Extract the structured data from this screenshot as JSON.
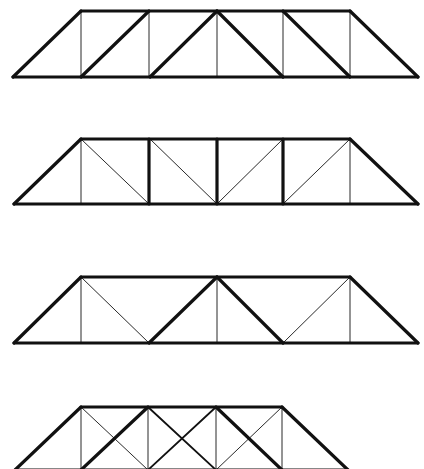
{
  "diagram": {
    "title": "",
    "background": "#ffffff",
    "stroke_color": "#111111",
    "stroke_widths": {
      "thick": 3.2,
      "medium": 1.8,
      "thin": 0.9
    },
    "trusses": [
      {
        "name": "truss-1",
        "type": "howe-style",
        "top_y": 11,
        "bottom_y": 77,
        "members": [
          {
            "x1": 13,
            "y1": 77,
            "x2": 418,
            "y2": 77,
            "w": "thick",
            "role": "bottom-chord"
          },
          {
            "x1": 81,
            "y1": 11,
            "x2": 350,
            "y2": 11,
            "w": "thick",
            "role": "top-chord"
          },
          {
            "x1": 13,
            "y1": 77,
            "x2": 81,
            "y2": 11,
            "w": "thick",
            "role": "end-post-left"
          },
          {
            "x1": 350,
            "y1": 11,
            "x2": 418,
            "y2": 77,
            "w": "thick",
            "role": "end-post-right"
          },
          {
            "x1": 81,
            "y1": 11,
            "x2": 81,
            "y2": 77,
            "w": "thin",
            "role": "vertical"
          },
          {
            "x1": 149,
            "y1": 11,
            "x2": 149,
            "y2": 77,
            "w": "thin",
            "role": "vertical"
          },
          {
            "x1": 217,
            "y1": 11,
            "x2": 217,
            "y2": 77,
            "w": "thin",
            "role": "vertical"
          },
          {
            "x1": 283,
            "y1": 11,
            "x2": 283,
            "y2": 77,
            "w": "thin",
            "role": "vertical"
          },
          {
            "x1": 350,
            "y1": 11,
            "x2": 350,
            "y2": 77,
            "w": "thin",
            "role": "vertical"
          },
          {
            "x1": 81,
            "y1": 77,
            "x2": 149,
            "y2": 11,
            "w": "thick",
            "role": "diagonal"
          },
          {
            "x1": 150,
            "y1": 77,
            "x2": 217,
            "y2": 11,
            "w": "thick",
            "role": "diagonal"
          },
          {
            "x1": 217,
            "y1": 11,
            "x2": 283,
            "y2": 77,
            "w": "thick",
            "role": "diagonal"
          },
          {
            "x1": 283,
            "y1": 11,
            "x2": 350,
            "y2": 77,
            "w": "thick",
            "role": "diagonal"
          }
        ]
      },
      {
        "name": "truss-2",
        "type": "pratt-style",
        "top_y": 139,
        "bottom_y": 204,
        "members": [
          {
            "x1": 14,
            "y1": 204,
            "x2": 418,
            "y2": 204,
            "w": "thick",
            "role": "bottom-chord"
          },
          {
            "x1": 81,
            "y1": 139,
            "x2": 350,
            "y2": 139,
            "w": "thick",
            "role": "top-chord"
          },
          {
            "x1": 14,
            "y1": 204,
            "x2": 81,
            "y2": 139,
            "w": "thick",
            "role": "end-post-left"
          },
          {
            "x1": 350,
            "y1": 139,
            "x2": 418,
            "y2": 204,
            "w": "thick",
            "role": "end-post-right"
          },
          {
            "x1": 81,
            "y1": 139,
            "x2": 81,
            "y2": 204,
            "w": "thin",
            "role": "vertical"
          },
          {
            "x1": 149,
            "y1": 139,
            "x2": 149,
            "y2": 204,
            "w": "thick",
            "role": "vertical"
          },
          {
            "x1": 217,
            "y1": 139,
            "x2": 217,
            "y2": 204,
            "w": "thick",
            "role": "vertical"
          },
          {
            "x1": 283,
            "y1": 139,
            "x2": 283,
            "y2": 204,
            "w": "thick",
            "role": "vertical"
          },
          {
            "x1": 350,
            "y1": 139,
            "x2": 350,
            "y2": 204,
            "w": "thin",
            "role": "vertical"
          },
          {
            "x1": 81,
            "y1": 139,
            "x2": 149,
            "y2": 204,
            "w": "thin",
            "role": "diagonal"
          },
          {
            "x1": 150,
            "y1": 139,
            "x2": 217,
            "y2": 204,
            "w": "thin",
            "role": "diagonal"
          },
          {
            "x1": 217,
            "y1": 204,
            "x2": 283,
            "y2": 139,
            "w": "thin",
            "role": "diagonal"
          },
          {
            "x1": 283,
            "y1": 204,
            "x2": 350,
            "y2": 139,
            "w": "thin",
            "role": "diagonal"
          }
        ]
      },
      {
        "name": "truss-3",
        "type": "warren-with-verticals",
        "top_y": 277,
        "bottom_y": 343,
        "members": [
          {
            "x1": 14,
            "y1": 343,
            "x2": 418,
            "y2": 343,
            "w": "thick",
            "role": "bottom-chord"
          },
          {
            "x1": 81,
            "y1": 277,
            "x2": 350,
            "y2": 277,
            "w": "thick",
            "role": "top-chord"
          },
          {
            "x1": 14,
            "y1": 343,
            "x2": 81,
            "y2": 277,
            "w": "thick",
            "role": "end-post-left"
          },
          {
            "x1": 350,
            "y1": 277,
            "x2": 418,
            "y2": 343,
            "w": "thick",
            "role": "end-post-right"
          },
          {
            "x1": 81,
            "y1": 277,
            "x2": 81,
            "y2": 343,
            "w": "thin",
            "role": "vertical"
          },
          {
            "x1": 217,
            "y1": 277,
            "x2": 217,
            "y2": 343,
            "w": "thin",
            "role": "vertical"
          },
          {
            "x1": 350,
            "y1": 277,
            "x2": 350,
            "y2": 343,
            "w": "thin",
            "role": "vertical"
          },
          {
            "x1": 81,
            "y1": 277,
            "x2": 149,
            "y2": 343,
            "w": "thin",
            "role": "diagonal"
          },
          {
            "x1": 149,
            "y1": 343,
            "x2": 217,
            "y2": 277,
            "w": "thick",
            "role": "diagonal"
          },
          {
            "x1": 217,
            "y1": 277,
            "x2": 283,
            "y2": 343,
            "w": "thick",
            "role": "diagonal"
          },
          {
            "x1": 283,
            "y1": 343,
            "x2": 350,
            "y2": 277,
            "w": "thin",
            "role": "diagonal"
          }
        ]
      },
      {
        "name": "truss-4",
        "type": "double-diagonal-cropped",
        "top_y": 407,
        "bottom_y": 470,
        "members": [
          {
            "x1": 15,
            "y1": 470,
            "x2": 348,
            "y2": 470,
            "w": "thick",
            "role": "bottom-chord"
          },
          {
            "x1": 81,
            "y1": 407,
            "x2": 282,
            "y2": 407,
            "w": "thick",
            "role": "top-chord"
          },
          {
            "x1": 15,
            "y1": 470,
            "x2": 81,
            "y2": 407,
            "w": "thick",
            "role": "end-post-left"
          },
          {
            "x1": 282,
            "y1": 407,
            "x2": 348,
            "y2": 470,
            "w": "thick",
            "role": "end-post-right"
          },
          {
            "x1": 81,
            "y1": 407,
            "x2": 81,
            "y2": 470,
            "w": "thin",
            "role": "vertical"
          },
          {
            "x1": 148,
            "y1": 407,
            "x2": 148,
            "y2": 470,
            "w": "thin",
            "role": "vertical"
          },
          {
            "x1": 216,
            "y1": 407,
            "x2": 216,
            "y2": 470,
            "w": "thin",
            "role": "vertical"
          },
          {
            "x1": 282,
            "y1": 407,
            "x2": 282,
            "y2": 470,
            "w": "thin",
            "role": "vertical"
          },
          {
            "x1": 81,
            "y1": 470,
            "x2": 148,
            "y2": 407,
            "w": "thick",
            "role": "diagonal"
          },
          {
            "x1": 81,
            "y1": 407,
            "x2": 148,
            "y2": 470,
            "w": "thin",
            "role": "diagonal"
          },
          {
            "x1": 148,
            "y1": 407,
            "x2": 216,
            "y2": 470,
            "w": "medium",
            "role": "diagonal"
          },
          {
            "x1": 148,
            "y1": 470,
            "x2": 216,
            "y2": 407,
            "w": "medium",
            "role": "diagonal"
          },
          {
            "x1": 216,
            "y1": 407,
            "x2": 282,
            "y2": 470,
            "w": "thick",
            "role": "diagonal"
          },
          {
            "x1": 216,
            "y1": 470,
            "x2": 282,
            "y2": 407,
            "w": "thin",
            "role": "diagonal"
          }
        ]
      }
    ]
  }
}
